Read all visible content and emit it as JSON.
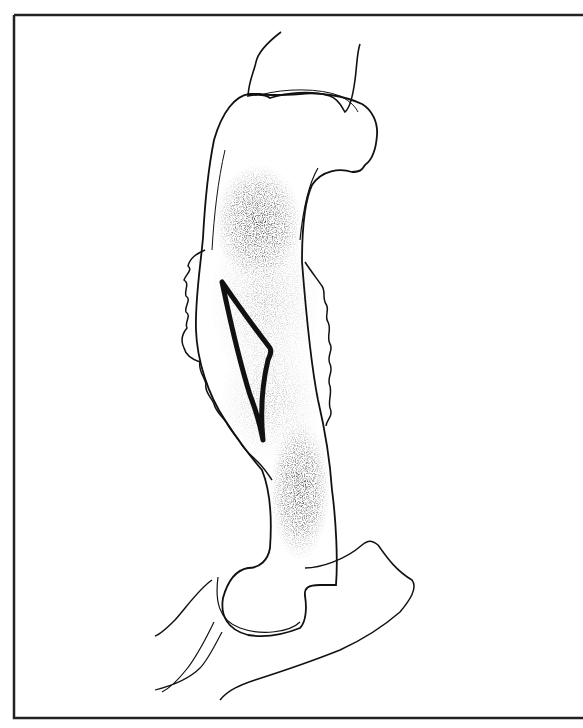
{
  "figure": {
    "caption": "",
    "colors": {
      "background": "#ffffff",
      "ink": "#111111",
      "frame": "#222222",
      "stipple": "#333333"
    }
  }
}
